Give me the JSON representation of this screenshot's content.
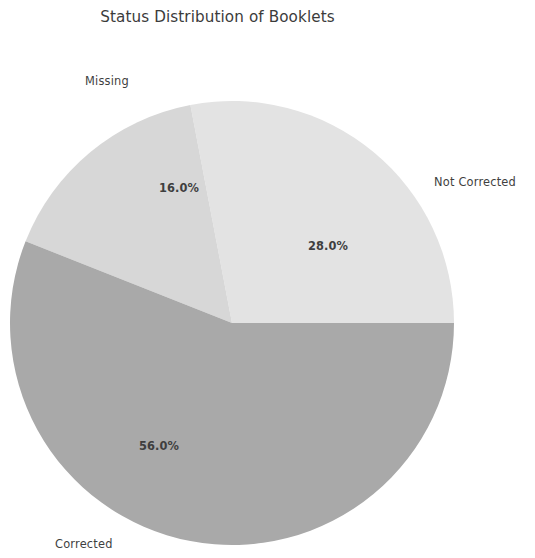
{
  "chart_data": {
    "type": "pie",
    "title": "Status Distribution of Booklets",
    "xlabel": "",
    "ylabel": "",
    "grid": false,
    "legend": "none",
    "labels_position": "outside",
    "autopct_format": "%.1f%%",
    "startangle": 0,
    "counterclock": true,
    "center": [
      232,
      323
    ],
    "radius": 222,
    "categories": [
      "Not Corrected",
      "Missing",
      "Corrected"
    ],
    "values": [
      28.0,
      16.0,
      56.0
    ],
    "slices": [
      {
        "label": "Not Corrected",
        "value": 28.0,
        "pct_text": "28.0%",
        "color": "#e3e3e3",
        "start_angle_deg": 0.0,
        "end_angle_deg": 100.8
      },
      {
        "label": "Missing",
        "value": 16.0,
        "pct_text": "16.0%",
        "color": "#d7d7d7",
        "start_angle_deg": 100.8,
        "end_angle_deg": 158.4
      },
      {
        "label": "Corrected",
        "value": 56.0,
        "pct_text": "56.0%",
        "color": "#a9a9a9",
        "start_angle_deg": 158.4,
        "end_angle_deg": 360.0
      }
    ],
    "colors": {
      "not_corrected": "#e3e3e3",
      "missing": "#d7d7d7",
      "corrected": "#a9a9a9",
      "title_text": "#3b3b3b",
      "label_text": "#3f3f3f",
      "background": "#ffffff"
    }
  },
  "figure": {
    "title": "Status Distribution of Booklets",
    "labels": {
      "missing": "Missing",
      "not_corrected": "Not Corrected",
      "corrected": "Corrected"
    },
    "percentages": {
      "missing": "16.0%",
      "not_corrected": "28.0%",
      "corrected": "56.0%"
    }
  }
}
